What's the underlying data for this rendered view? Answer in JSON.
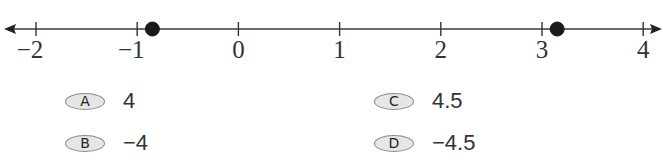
{
  "chart_data": {
    "type": "number_line",
    "range": [
      -2,
      4
    ],
    "ticks": [
      -2,
      -1,
      0,
      1,
      2,
      3,
      4
    ],
    "tick_labels": [
      "−2",
      "−1",
      "0",
      "1",
      "2",
      "3",
      "4"
    ],
    "points": [
      {
        "label": "point-1",
        "value": -0.85,
        "filled": true
      },
      {
        "label": "point-2",
        "value": 3.15,
        "filled": true
      }
    ],
    "arrows": {
      "left": true,
      "right": true
    },
    "colors": {
      "line": "#333333",
      "point": "#1a1a1a"
    }
  },
  "options": [
    {
      "letter": "A",
      "text": "4"
    },
    {
      "letter": "B",
      "text": "−4"
    },
    {
      "letter": "C",
      "text": "4.5"
    },
    {
      "letter": "D",
      "text": "−4.5"
    }
  ]
}
